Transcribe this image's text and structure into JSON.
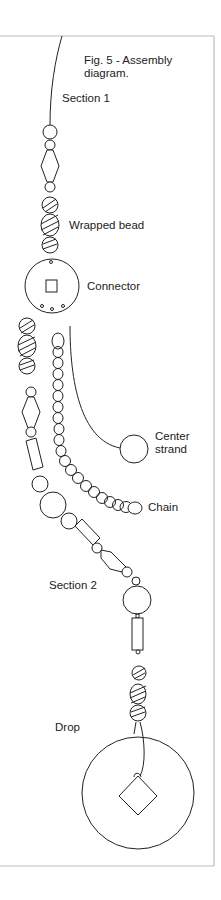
{
  "figure": {
    "caption_line1": "Fig. 5 - Assembly",
    "caption_line2": "diagram."
  },
  "labels": {
    "section1": "Section 1",
    "wrapped_bead": "Wrapped bead",
    "connector": "Connector",
    "center_strand_line1": "Center",
    "center_strand_line2": "strand",
    "chain": "Chain",
    "section2": "Section 2",
    "drop": "Drop"
  },
  "colors": {
    "stroke": "#222222",
    "frame": "#bdbdbd",
    "background": "#ffffff"
  }
}
